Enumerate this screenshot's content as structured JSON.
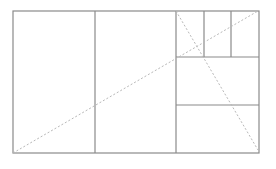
{
  "diagram": {
    "title": "",
    "width": 276,
    "height": 169,
    "colors": {
      "line": "#8a8a8a",
      "dashed": "#b8b8b8",
      "background": "#ffffff"
    },
    "outer_rect": {
      "x1": 13,
      "y1": 11,
      "x2": 259,
      "y2": 153
    },
    "solid_lines": [
      {
        "name": "divider-1",
        "x1": 95,
        "y1": 11,
        "x2": 95,
        "y2": 153
      },
      {
        "name": "divider-2",
        "x1": 176,
        "y1": 11,
        "x2": 176,
        "y2": 153
      },
      {
        "name": "divider-3",
        "x1": 176,
        "y1": 57,
        "x2": 259,
        "y2": 57
      },
      {
        "name": "divider-4",
        "x1": 176,
        "y1": 105,
        "x2": 259,
        "y2": 105
      },
      {
        "name": "divider-5",
        "x1": 204,
        "y1": 11,
        "x2": 204,
        "y2": 57
      },
      {
        "name": "divider-6",
        "x1": 231,
        "y1": 11,
        "x2": 231,
        "y2": 57
      }
    ],
    "dashed_lines": [
      {
        "name": "diagonal-main",
        "x1": 13,
        "y1": 153,
        "x2": 258,
        "y2": 11
      },
      {
        "name": "diagonal-secondary",
        "x1": 176,
        "y1": 11,
        "x2": 258,
        "y2": 150
      }
    ]
  }
}
